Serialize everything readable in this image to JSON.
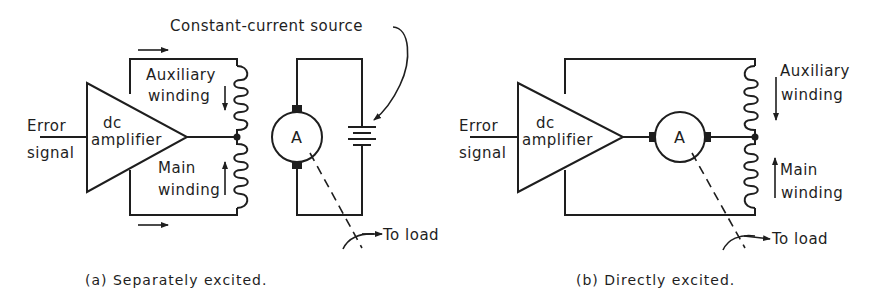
{
  "figure": {
    "panel_a": {
      "caption": "(a) Separately excited.",
      "input_label_line1": "Error",
      "input_label_line2": "signal",
      "amplifier_line1": "dc",
      "amplifier_line2": "amplifier",
      "aux_winding_line1": "Auxiliary",
      "aux_winding_line2": "winding",
      "main_winding_line1": "Main",
      "main_winding_line2": "winding",
      "motor_label": "A",
      "source_label": "Constant-current source",
      "load_label": "To load"
    },
    "panel_b": {
      "caption": "(b) Directly excited.",
      "input_label_line1": "Error",
      "input_label_line2": "signal",
      "amplifier_line1": "dc",
      "amplifier_line2": "amplifier",
      "aux_winding_line1": "Auxiliary",
      "aux_winding_line2": "winding",
      "main_winding_line1": "Main",
      "main_winding_line2": "winding",
      "motor_label": "A",
      "load_label": "To load"
    }
  }
}
